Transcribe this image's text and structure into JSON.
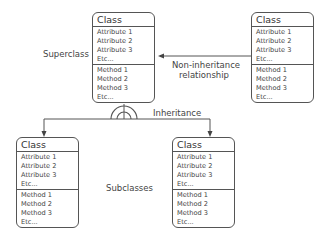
{
  "diagram": {
    "labels": {
      "superclass": "Superclass",
      "subclasses": "Subclasses",
      "inheritance": "Inheritance",
      "non_inheritance_line1": "Non-inheritance",
      "non_inheritance_line2": "relationship"
    },
    "classes": {
      "superclass": {
        "title": "Class",
        "attributes": [
          "Attribute 1",
          "Attribute 2",
          "Attribute 3",
          "Etc..."
        ],
        "methods": [
          "Method 1",
          "Method 2",
          "Method 3",
          "Etc..."
        ]
      },
      "related": {
        "title": "Class",
        "attributes": [
          "Attribute 1",
          "Attribute 2",
          "Attribute 3",
          "Etc..."
        ],
        "methods": [
          "Method 1",
          "Method 2",
          "Method 3",
          "Etc..."
        ]
      },
      "subclass_left": {
        "title": "Class",
        "attributes": [
          "Attribute 1",
          "Attribute 2",
          "Attribute 3",
          "Etc..."
        ],
        "methods": [
          "Method 1",
          "Method 2",
          "Method 3",
          "Etc..."
        ]
      },
      "subclass_right": {
        "title": "Class",
        "attributes": [
          "Attribute 1",
          "Attribute 2",
          "Attribute 3",
          "Etc..."
        ],
        "methods": [
          "Method 1",
          "Method 2",
          "Method 3",
          "Etc..."
        ]
      }
    },
    "colors": {
      "stroke": "#555555",
      "text": "#444444",
      "background": "#ffffff"
    }
  }
}
